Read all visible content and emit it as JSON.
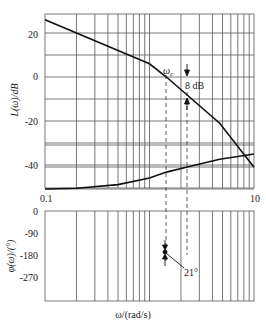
{
  "chart_data": [
    {
      "type": "line",
      "title": "",
      "xlabel": "",
      "ylabel": "L(ω)/dB",
      "xscale": "log",
      "xlim": [
        0.1,
        10
      ],
      "ylim": [
        -50,
        29
      ],
      "grid": true,
      "x_tick_labels": [
        "0.1",
        "10"
      ],
      "y_ticks": [
        20,
        0,
        -20,
        -40
      ],
      "y_tick_labels": [
        "20",
        "0",
        "-20",
        "-40"
      ],
      "series": [
        {
          "name": "L(ω) asymptotic magnitude",
          "x": [
            0.1,
            1.0,
            1.45,
            4.7,
            10
          ],
          "y": [
            26,
            6,
            0,
            -21,
            -41
          ]
        }
      ],
      "annotations": [
        {
          "text": "ωc",
          "x": 1.45,
          "y": 0
        },
        {
          "text": "8 dB",
          "x": 2.3,
          "y": 0,
          "note": "gain margin arrows"
        }
      ]
    },
    {
      "type": "line",
      "title": "",
      "xlabel": "ω/(rad/s)",
      "ylabel": "φ(ω)/(°)",
      "xscale": "log",
      "xlim": [
        0.1,
        10
      ],
      "ylim": [
        -360,
        0
      ],
      "grid": true,
      "y_ticks": [
        0,
        -90,
        -180,
        -270
      ],
      "y_tick_labels": [
        "0",
        "-90",
        "-180",
        "-270"
      ],
      "series": [
        {
          "name": "φ(ω) phase",
          "x": [
            0.1,
            0.2,
            0.5,
            1.0,
            1.45,
            2.3,
            4.7,
            10
          ],
          "y": [
            -90,
            -93,
            -108,
            -135,
            -159,
            -180,
            -212,
            -233
          ]
        }
      ],
      "annotations": [
        {
          "text": "21°",
          "x": 1.45,
          "y": -159,
          "note": "phase margin"
        }
      ]
    }
  ],
  "labels": {
    "mag_ylabel": "L(ω)/dB",
    "phase_ylabel": "φ(ω)/(°)",
    "xlabel": "ω/(rad/s)",
    "x_min": "0.1",
    "x_max": "10",
    "mag_ticks": [
      "20",
      "0",
      "-20",
      "-40"
    ],
    "phase_ticks": [
      "0",
      "-90",
      "-180",
      "-270"
    ],
    "wc": "ω",
    "wc_sub": "c",
    "gain_margin": "8 dB",
    "phase_margin": "21°"
  }
}
